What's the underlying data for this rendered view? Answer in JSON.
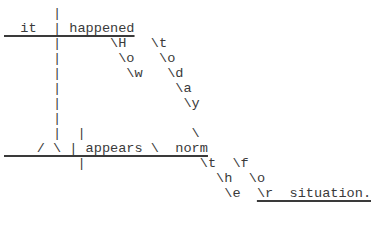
{
  "diagram": {
    "type": "sentence-diagram",
    "words": {
      "subject": "it",
      "verb": "happened",
      "adverb": "How",
      "adverb_modifier": "today",
      "clause_verb": "appears",
      "clause_complement": "norm",
      "article": "the",
      "preposition": "for",
      "object_of_preposition": "situation."
    },
    "lines": [
      "      |",
      "  it  | happened",
      "      |      \\H   \\t",
      "      |       \\o   \\o",
      "      |        \\w   \\d",
      "      |              \\a",
      "      |               \\y",
      "      |",
      "      |  |             \\",
      "    / \\ | appears \\  norm",
      "         |              \\t  \\f",
      "                          \\h  \\o",
      "                           \\e  \\r  situation."
    ]
  }
}
